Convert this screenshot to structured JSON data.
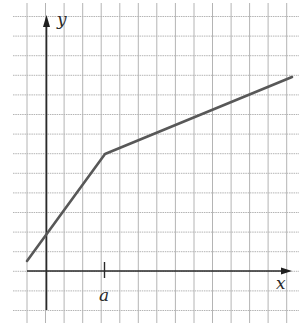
{
  "chart_data": {
    "type": "line",
    "title": "",
    "xlabel": "x",
    "ylabel": "y",
    "tick_labels": {
      "x": [
        "a"
      ],
      "y": []
    },
    "grid": true,
    "grid_units": {
      "x_origin_col": 1,
      "a_col": 4,
      "cols": 15,
      "rows": 16
    },
    "series": [
      {
        "name": "y(x)",
        "points_grid_units": [
          {
            "x": -1.0,
            "y": 0.5
          },
          {
            "x": 3.0,
            "y": 6.0
          },
          {
            "x": 13.3,
            "y": 10.0
          }
        ]
      }
    ],
    "xlim": [
      -1.8,
      13.5
    ],
    "ylim": [
      -2.0,
      13.0
    ]
  },
  "labels": {
    "x_axis": "x",
    "y_axis": "y",
    "a_mark": "a"
  },
  "colors": {
    "grid": "#b4b4b4",
    "axis": "#2a2a2a",
    "line": "#585858",
    "background": "#ffffff"
  }
}
